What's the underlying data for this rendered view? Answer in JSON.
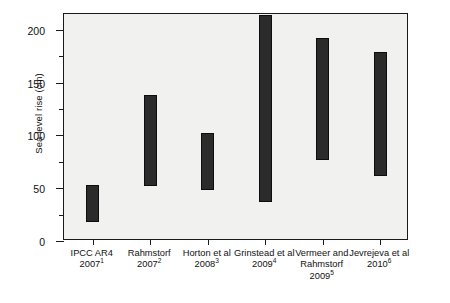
{
  "chart_data": {
    "type": "bar",
    "subtype": "range-bar",
    "title": "",
    "xlabel": "",
    "ylabel": "Sea level rise (cm)",
    "ylim": [
      0,
      215
    ],
    "yticks_major": [
      0,
      50,
      100,
      150,
      200
    ],
    "yticks_minor": [
      25,
      75,
      125,
      175
    ],
    "grid": false,
    "legend": null,
    "categories": [
      "IPCC AR4 2007",
      "Rahmstorf 2007",
      "Horton et al 2008",
      "Grinstead et al 2009",
      "Vermeer and Rahmstorf 2009",
      "Jevrejeva et al 2010"
    ],
    "category_labels": [
      {
        "name": "IPCC AR4",
        "year": "2007",
        "ref": "1"
      },
      {
        "name": "Rahmstorf",
        "year": "2007",
        "ref": "2"
      },
      {
        "name": "Horton et al",
        "year": "2008",
        "ref": "3"
      },
      {
        "name": "Grinstead et al",
        "year": "2009",
        "ref": "4"
      },
      {
        "name": "Vermeer and\nRahmstorf",
        "year": "2009",
        "ref": "5"
      },
      {
        "name": "Jevrejeva et al",
        "year": "2010",
        "ref": "6"
      }
    ],
    "ranges": [
      {
        "category": "IPCC AR4 2007",
        "low": 18,
        "high": 53
      },
      {
        "category": "Rahmstorf 2007",
        "low": 52,
        "high": 138
      },
      {
        "category": "Horton et al 2008",
        "low": 48,
        "high": 102
      },
      {
        "category": "Grinstead et al 2009",
        "low": 37,
        "high": 214
      },
      {
        "category": "Vermeer and Rahmstorf 2009",
        "low": 77,
        "high": 192
      },
      {
        "category": "Jevrejeva et al 2010",
        "low": 62,
        "high": 179
      }
    ],
    "colors": {
      "bar": "#2b2b2b",
      "bar_edge": "#0d0d0d",
      "plot_background": "#f1f1ef",
      "axis": "#1a1a1a",
      "text": "#111111"
    }
  }
}
